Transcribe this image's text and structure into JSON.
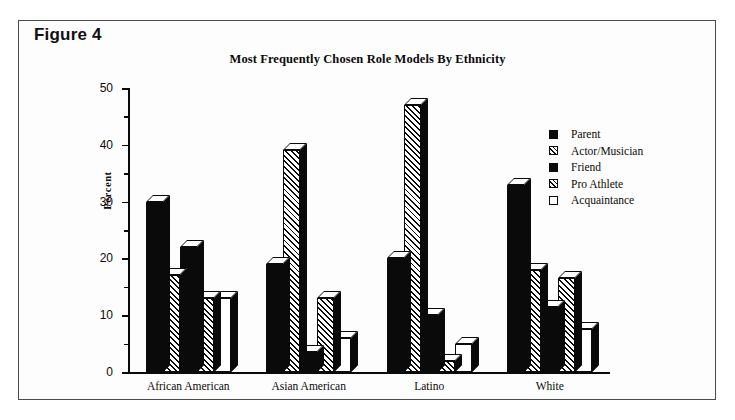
{
  "figure": {
    "label": "Figure 4"
  },
  "chart_data": {
    "type": "bar",
    "title": "Most Frequently Chosen Role Models By Ethnicity",
    "xlabel": "",
    "ylabel": "Percent",
    "ylim": [
      0,
      50
    ],
    "ytick_labels": [
      "0",
      "10",
      "20",
      "30",
      "40",
      "50"
    ],
    "ytick_values": [
      0,
      10,
      20,
      30,
      40,
      50
    ],
    "yminor_values": [
      5,
      15,
      25,
      35,
      45
    ],
    "grid": false,
    "legend_position": "right",
    "categories": [
      "African American",
      "Asian American",
      "Latino",
      "White"
    ],
    "series": [
      {
        "name": "Parent",
        "fill": "solid",
        "values": [
          30,
          19,
          20,
          33
        ]
      },
      {
        "name": "Actor/Musician",
        "fill": "hatch",
        "values": [
          17,
          39,
          47,
          18
        ]
      },
      {
        "name": "Friend",
        "fill": "solid",
        "values": [
          22,
          3.5,
          10,
          11.5
        ]
      },
      {
        "name": "Pro Athlete",
        "fill": "hatch",
        "values": [
          13,
          13,
          2,
          16.5
        ]
      },
      {
        "name": "Acquaintance",
        "fill": "empty",
        "values": [
          13,
          6,
          5,
          7.5
        ]
      }
    ]
  },
  "colors": {
    "ink": "#0a0a0a",
    "paper": "#ffffff",
    "frame": "#4a4a4a"
  }
}
